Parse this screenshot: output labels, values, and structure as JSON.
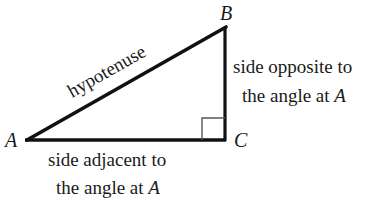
{
  "diagram": {
    "type": "right-triangle",
    "vertices": {
      "A": {
        "label": "A",
        "x": 26,
        "y": 140
      },
      "B": {
        "label": "B",
        "x": 225,
        "y": 27
      },
      "C": {
        "label": "C",
        "x": 225,
        "y": 140
      }
    },
    "right_angle_at": "C",
    "labels": {
      "hypotenuse": "hypotenuse",
      "opposite_line1": "side opposite to",
      "opposite_line2_prefix": "the angle at ",
      "opposite_line2_var": "A",
      "adjacent_line1": "side adjacent to",
      "adjacent_line2_prefix": "the angle at ",
      "adjacent_line2_var": "A"
    },
    "colors": {
      "stroke": "#111111",
      "text": "#1a1a1a",
      "background": "#ffffff"
    }
  }
}
